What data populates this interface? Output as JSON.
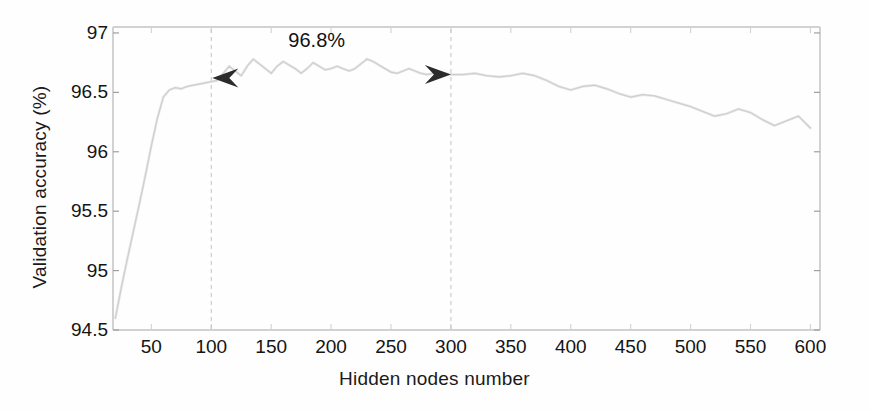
{
  "figure": {
    "background": "#fefefe",
    "axis_color": "#d2d2d2",
    "curve_color": "#cfcfcf",
    "marker_color": "#2b2b2b",
    "text_color": "#141414"
  },
  "axes": {
    "ylabel": "Validation accuracy (%)",
    "xlabel": "Hidden nodes number",
    "yticks": [
      "94.5",
      "95",
      "95.5",
      "96",
      "96.5",
      "97"
    ],
    "ytick_values": [
      94.5,
      95,
      95.5,
      96,
      96.5,
      97
    ],
    "xticks": [
      "50",
      "100",
      "150",
      "200",
      "250",
      "300",
      "350",
      "400",
      "450",
      "500",
      "550",
      "600"
    ],
    "xtick_values": [
      50,
      100,
      150,
      200,
      250,
      300,
      350,
      400,
      450,
      500,
      550,
      600
    ],
    "xlim": [
      18,
      608
    ],
    "ylim": [
      94.5,
      97.05
    ],
    "grid": false
  },
  "annotations": [
    {
      "name": "peak-value-label",
      "text": "96.8%",
      "x": 188,
      "y": 97.0
    }
  ],
  "markers": {
    "left_arrow": {
      "name": "range-start-arrow",
      "glyph": "left-arrow",
      "x": 100,
      "y": 96.62
    },
    "right_arrow": {
      "name": "range-end-arrow",
      "glyph": "right-arrow",
      "x": 300,
      "y": 96.65
    },
    "dashed_lines": [
      {
        "name": "range-start-dashed-line",
        "x": 100
      },
      {
        "name": "range-end-dashed-line",
        "x": 300
      }
    ]
  },
  "chart_data": {
    "type": "line",
    "title": "",
    "xlabel": "Hidden nodes number",
    "ylabel": "Validation accuracy (%)",
    "xlim": [
      18,
      608
    ],
    "ylim": [
      94.5,
      97.05
    ],
    "grid": false,
    "legend": null,
    "series": [
      {
        "name": "Validation accuracy",
        "x": [
          20,
          25,
          30,
          35,
          40,
          45,
          50,
          55,
          60,
          65,
          70,
          75,
          80,
          85,
          90,
          95,
          100,
          105,
          110,
          115,
          120,
          125,
          130,
          135,
          140,
          145,
          150,
          155,
          160,
          165,
          170,
          175,
          180,
          185,
          190,
          195,
          200,
          205,
          210,
          215,
          220,
          225,
          230,
          235,
          240,
          245,
          250,
          255,
          260,
          265,
          270,
          275,
          280,
          285,
          290,
          295,
          300,
          310,
          320,
          330,
          340,
          350,
          360,
          370,
          380,
          390,
          400,
          410,
          420,
          430,
          440,
          450,
          460,
          470,
          480,
          490,
          500,
          510,
          520,
          530,
          540,
          550,
          560,
          570,
          580,
          590,
          600
        ],
        "y": [
          94.6,
          94.86,
          95.1,
          95.33,
          95.56,
          95.8,
          96.05,
          96.28,
          96.46,
          96.52,
          96.54,
          96.53,
          96.55,
          96.56,
          96.57,
          96.58,
          96.59,
          96.6,
          96.66,
          96.72,
          96.68,
          96.64,
          96.72,
          96.78,
          96.74,
          96.7,
          96.66,
          96.72,
          96.76,
          96.73,
          96.7,
          96.66,
          96.7,
          96.75,
          96.72,
          96.69,
          96.7,
          96.72,
          96.7,
          96.68,
          96.7,
          96.74,
          96.78,
          96.76,
          96.73,
          96.7,
          96.67,
          96.66,
          96.68,
          96.7,
          96.68,
          96.66,
          96.65,
          96.66,
          96.67,
          96.66,
          96.65,
          96.65,
          96.66,
          96.64,
          96.63,
          96.64,
          96.66,
          96.64,
          96.6,
          96.55,
          96.52,
          96.55,
          96.56,
          96.53,
          96.49,
          96.46,
          96.48,
          96.47,
          96.44,
          96.41,
          96.38,
          96.34,
          96.3,
          96.32,
          96.36,
          96.33,
          96.27,
          96.22,
          96.26,
          96.3,
          96.2
        ],
        "style": "solid",
        "color": "#cfcfcf"
      }
    ]
  }
}
